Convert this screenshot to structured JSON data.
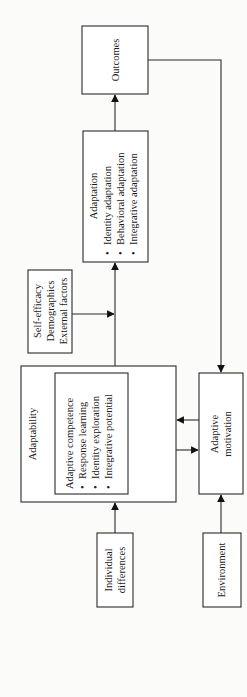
{
  "diagram": {
    "orientation": "rotated-90-ccw",
    "nodes": {
      "outcomes": {
        "lines": [
          "Outcomes"
        ]
      },
      "adaptation": {
        "title": "Adaptation",
        "bullets": [
          "Identity adaptation",
          "Behavioral adaptation",
          "Integrative adaptation"
        ]
      },
      "moderators": {
        "lines": [
          "Self-efficacy",
          "Demographics",
          "External factors"
        ]
      },
      "adaptability": {
        "title": "Adaptability"
      },
      "adaptive_competence": {
        "title": "Adaptive competence",
        "bullets": [
          "Response learning",
          "Identity exploration",
          "Integrative potential"
        ]
      },
      "adaptive_motivation": {
        "lines": [
          "Adaptive",
          "motivation"
        ]
      },
      "individual_differences": {
        "lines": [
          "Individual",
          "differences"
        ]
      },
      "environment": {
        "lines": [
          "Environment"
        ]
      }
    },
    "bullet_glyph": "•",
    "edges": [
      {
        "from": "individual_differences",
        "to": "adaptability"
      },
      {
        "from": "environment",
        "to": "adaptive_motivation"
      },
      {
        "from": "adaptive_motivation",
        "to": "adaptability"
      },
      {
        "from": "adaptability",
        "to": "adaptive_motivation"
      },
      {
        "from": "adaptability",
        "to": "adaptation"
      },
      {
        "from": "moderators",
        "to": "adaptability-adaptation-link"
      },
      {
        "from": "adaptation",
        "to": "outcomes"
      },
      {
        "from": "outcomes",
        "to": "adaptive_motivation"
      }
    ]
  }
}
